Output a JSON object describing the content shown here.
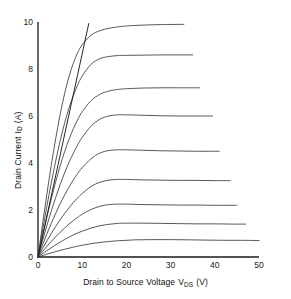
{
  "figure": {
    "name": "mosfet-output-characteristics"
  },
  "axes": {
    "x_title_prefix": "Drain to Source Voltage",
    "x_title_symbol": "V",
    "x_title_sub": "DS",
    "x_title_unit": "(V)",
    "y_title_prefix": "Drain Current",
    "y_title_symbol": "I",
    "y_title_sub": "D",
    "y_title_unit": "(A)",
    "x_ticks": [
      "0",
      "10",
      "20",
      "30",
      "40",
      "50"
    ],
    "y_ticks": [
      "0",
      "2",
      "4",
      "6",
      "8",
      "10"
    ]
  },
  "chart_data": {
    "type": "line",
    "title": "",
    "xlabel": "Drain to Source Voltage VDS (V)",
    "ylabel": "Drain Current ID (A)",
    "xlim": [
      0,
      50
    ],
    "ylim": [
      0,
      10
    ],
    "xticks": [
      0,
      10,
      20,
      30,
      40,
      50
    ],
    "yticks": [
      0,
      2,
      4,
      6,
      8,
      10
    ],
    "grid": false,
    "legend": "none",
    "line_color": "#3a3a3a",
    "series": [
      {
        "name": "curve-1",
        "saturation_current": 9.9,
        "knee_voltage": 8.5,
        "x_end": 33.0,
        "x": [
          0,
          1,
          2,
          3,
          4,
          5,
          6,
          7,
          8,
          9,
          10,
          12,
          14,
          16,
          18,
          20,
          24,
          28,
          33
        ],
        "y": [
          0,
          1.35,
          2.66,
          3.9,
          5.03,
          6.05,
          6.93,
          7.66,
          8.25,
          8.7,
          9.03,
          9.44,
          9.63,
          9.73,
          9.79,
          9.83,
          9.87,
          9.89,
          9.9
        ]
      },
      {
        "name": "curve-2",
        "saturation_current": 8.6,
        "knee_voltage": 9.5,
        "x_end": 35.0,
        "x": [
          0,
          1,
          2,
          3,
          4,
          5,
          6,
          7,
          8,
          9,
          10,
          12,
          14,
          16,
          18,
          20,
          24,
          28,
          32,
          35
        ],
        "y": [
          0,
          1.1,
          2.15,
          3.15,
          4.08,
          4.93,
          5.68,
          6.33,
          6.88,
          7.33,
          7.7,
          8.2,
          8.44,
          8.53,
          8.57,
          8.58,
          8.59,
          8.6,
          8.6,
          8.6
        ]
      },
      {
        "name": "curve-3",
        "saturation_current": 7.2,
        "knee_voltage": 10.5,
        "x_end": 36.5,
        "x": [
          0,
          1,
          2,
          3,
          4,
          5,
          6,
          7,
          8,
          9,
          10,
          12,
          14,
          16,
          18,
          20,
          24,
          28,
          32,
          36.5
        ],
        "y": [
          0,
          0.86,
          1.69,
          2.47,
          3.2,
          3.87,
          4.47,
          5.0,
          5.46,
          5.85,
          6.18,
          6.65,
          6.92,
          7.06,
          7.13,
          7.16,
          7.19,
          7.2,
          7.2,
          7.2
        ]
      },
      {
        "name": "curve-4",
        "saturation_current": 6.0,
        "knee_voltage": 12.0,
        "x_end": 39.5,
        "x": [
          0,
          1,
          2,
          3,
          4,
          5,
          6,
          7,
          8,
          9,
          10,
          12,
          14,
          16,
          18,
          20,
          24,
          28,
          32,
          36,
          39.5
        ],
        "y": [
          0,
          0.68,
          1.33,
          1.95,
          2.53,
          3.07,
          3.57,
          4.02,
          4.42,
          4.78,
          5.09,
          5.57,
          5.86,
          6.0,
          6.05,
          6.05,
          6.03,
          6.01,
          6.0,
          6.0,
          6.0
        ]
      },
      {
        "name": "curve-5",
        "saturation_current": 4.5,
        "knee_voltage": 13.0,
        "x_end": 41.0,
        "x": [
          0,
          1,
          2,
          3,
          4,
          5,
          6,
          7,
          8,
          9,
          10,
          12,
          14,
          16,
          18,
          20,
          24,
          28,
          32,
          36,
          41
        ],
        "y": [
          0,
          0.5,
          0.98,
          1.43,
          1.86,
          2.26,
          2.63,
          2.97,
          3.28,
          3.56,
          3.8,
          4.18,
          4.42,
          4.53,
          4.56,
          4.56,
          4.54,
          4.52,
          4.51,
          4.5,
          4.5
        ]
      },
      {
        "name": "curve-6",
        "saturation_current": 3.25,
        "knee_voltage": 14.0,
        "x_end": 43.5,
        "x": [
          0,
          1,
          2,
          3,
          4,
          5,
          6,
          7,
          8,
          9,
          10,
          12,
          14,
          16,
          18,
          20,
          24,
          28,
          32,
          36,
          40,
          43.5
        ],
        "y": [
          0,
          0.35,
          0.68,
          1.0,
          1.3,
          1.58,
          1.85,
          2.09,
          2.32,
          2.52,
          2.7,
          3.0,
          3.18,
          3.27,
          3.3,
          3.3,
          3.28,
          3.27,
          3.26,
          3.26,
          3.25,
          3.25
        ]
      },
      {
        "name": "curve-7",
        "saturation_current": 2.2,
        "knee_voltage": 15.0,
        "x_end": 45.0,
        "x": [
          0,
          1,
          2,
          3,
          4,
          5,
          6,
          7,
          8,
          9,
          10,
          12,
          14,
          16,
          18,
          20,
          24,
          28,
          32,
          36,
          40,
          45
        ],
        "y": [
          0,
          0.23,
          0.45,
          0.66,
          0.86,
          1.05,
          1.23,
          1.4,
          1.55,
          1.69,
          1.82,
          2.02,
          2.16,
          2.23,
          2.25,
          2.25,
          2.23,
          2.22,
          2.21,
          2.21,
          2.2,
          2.2
        ]
      },
      {
        "name": "curve-8",
        "saturation_current": 1.4,
        "knee_voltage": 17.0,
        "x_end": 47.0,
        "x": [
          0,
          2,
          4,
          6,
          8,
          10,
          12,
          14,
          16,
          18,
          20,
          24,
          28,
          32,
          36,
          40,
          44,
          47
        ],
        "y": [
          0,
          0.27,
          0.52,
          0.74,
          0.94,
          1.1,
          1.23,
          1.33,
          1.39,
          1.43,
          1.44,
          1.44,
          1.43,
          1.42,
          1.41,
          1.41,
          1.4,
          1.4
        ]
      },
      {
        "name": "curve-9",
        "saturation_current": 0.7,
        "knee_voltage": 20.0,
        "x_end": 50.0,
        "x": [
          0,
          2,
          4,
          6,
          8,
          10,
          14,
          18,
          22,
          26,
          30,
          34,
          38,
          42,
          46,
          50
        ],
        "y": [
          0,
          0.12,
          0.23,
          0.33,
          0.42,
          0.5,
          0.62,
          0.69,
          0.73,
          0.74,
          0.74,
          0.73,
          0.72,
          0.71,
          0.71,
          0.7
        ]
      }
    ],
    "locus_line": {
      "name": "saturation-locus",
      "x": [
        0,
        11.5
      ],
      "y": [
        0,
        9.95
      ],
      "description": "straight steep line from origin"
    }
  }
}
